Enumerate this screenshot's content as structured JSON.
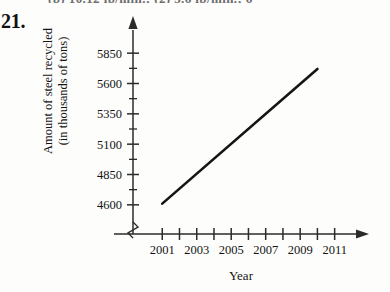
{
  "page": {
    "cut_top_line": "(b) 10.12 lb/min.; (2) 5.6 lb/min.; 6",
    "problem_number": "21."
  },
  "chart_data": {
    "type": "line",
    "title": "",
    "xlabel": "Year",
    "ylabel_line1": "Amount of steel recycled",
    "ylabel_line2": "(in thousands of tons)",
    "x": [
      2001,
      2010
    ],
    "values": [
      4610,
      5720
    ],
    "xlim": [
      2000,
      2011.6
    ],
    "ylim": [
      4475,
      5975
    ],
    "x_tick_labels": [
      "2001",
      "2003",
      "2005",
      "2007",
      "2009",
      "2011"
    ],
    "x_major_ticks": [
      2001,
      2002,
      2003,
      2004,
      2005,
      2006,
      2007,
      2008,
      2009,
      2010,
      2011
    ],
    "y_tick_labels": [
      "5850",
      "5600",
      "5350",
      "5100",
      "4850",
      "4600"
    ],
    "y_major_ticks": [
      4600,
      4850,
      5100,
      5350,
      5600,
      5850
    ],
    "y_minor_ticks": [
      4725,
      4975,
      5225,
      5475,
      5725
    ],
    "grid": false,
    "legend": "none",
    "axis_break": true,
    "line_color": "#151515",
    "axis_color": "#2b2b2b"
  }
}
